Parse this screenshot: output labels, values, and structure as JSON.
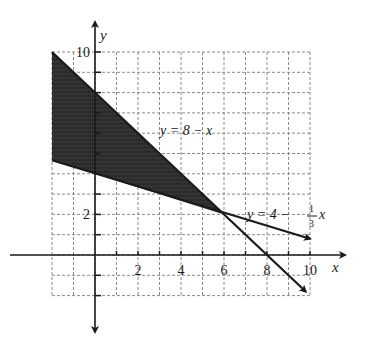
{
  "chart_data": {
    "type": "line",
    "title": "",
    "xlabel": "x",
    "ylabel": "y",
    "xlim": [
      -2,
      10
    ],
    "ylim": [
      -3,
      10
    ],
    "grid": true,
    "x_ticks": [
      2,
      4,
      6,
      8,
      10
    ],
    "y_ticks": [
      2,
      10
    ],
    "x_tick_labels": [
      "2",
      "4",
      "6",
      "8",
      "10"
    ],
    "y_tick_labels": [
      "2",
      "10"
    ],
    "series": [
      {
        "name": "y = 8 − x",
        "label": "y = 8 − x",
        "x": [
          -2,
          10
        ],
        "y": [
          10,
          -2
        ]
      },
      {
        "name": "y = 4 − (1/3)x",
        "label_main": "y = 4 − ",
        "label_num": "1",
        "label_den": "3",
        "label_var": "x",
        "x": [
          -2,
          10
        ],
        "y": [
          4.667,
          0.667
        ]
      }
    ],
    "shaded_region": {
      "description": "Region between the two lines for x < 6",
      "vertices": [
        [
          -2,
          10
        ],
        [
          6,
          2
        ],
        [
          -2,
          4.667
        ]
      ],
      "color": "#2a2a2a"
    },
    "intersection_point": [
      6,
      2
    ],
    "colors": {
      "line": "#1a1a1a",
      "grid": "#999999",
      "shade": "#2a2a2a"
    }
  }
}
